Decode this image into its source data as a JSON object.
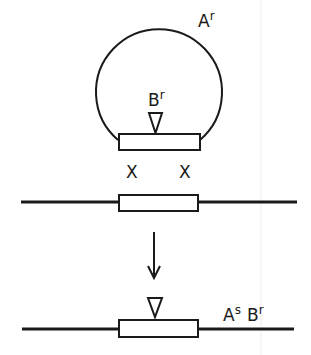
{
  "diagram": {
    "type": "recombination-schematic",
    "plasmid": {
      "resistance_label": {
        "base": "A",
        "superscript": "r"
      },
      "insert_label": {
        "base": "B",
        "superscript": "r"
      },
      "insert_marker": "triangle-down"
    },
    "crossover_marks": [
      "X",
      "X"
    ],
    "transition_arrow": "arrow-down",
    "result": {
      "insert_marker": "triangle-down",
      "label_1": {
        "base": "A",
        "superscript": "s"
      },
      "label_2": {
        "base": "B",
        "superscript": "r"
      }
    }
  }
}
